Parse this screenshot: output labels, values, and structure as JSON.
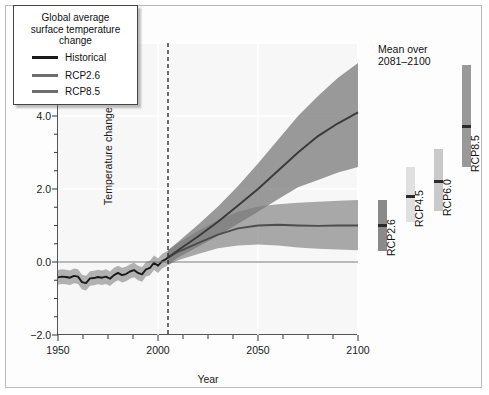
{
  "figure": {
    "background": "#ffffff",
    "frame_color": "#b9b9b9"
  },
  "axes": {
    "xlabel": "Year",
    "ylabel": "Temperature change (°C)",
    "xlim": [
      1950,
      2100
    ],
    "ylim": [
      -2.0,
      6.0
    ],
    "xticks": [
      1950,
      2000,
      2050,
      2100
    ],
    "xtick_labels": [
      "1950",
      "2000",
      "2050",
      "2100"
    ],
    "xticks_minor_step": 12.5,
    "yticks": [
      -2.0,
      0.0,
      2.0,
      4.0,
      6.0
    ],
    "ytick_labels": [
      "−2.0",
      "0.0",
      "2.0",
      "4.0",
      "6.0"
    ],
    "yticks_minor_step": 0.5,
    "grid": true,
    "grid_color": "#ffffff",
    "zero_line": 0.0,
    "historical_end_year": 2005
  },
  "legend": {
    "title": "Global average\nsurface temperature\nchange",
    "title_lines": [
      "Global average",
      "surface temperature",
      "change"
    ],
    "position": "upper-left-inside",
    "entries": [
      {
        "label": "Historical",
        "color": "#1a1a1a"
      },
      {
        "label": "RCP2.6",
        "color": "#6e6e6e"
      },
      {
        "label": "RCP8.5",
        "color": "#6e6e6e"
      }
    ]
  },
  "side_panel": {
    "title": "Mean over\n2081–2100",
    "title_lines": [
      "Mean over",
      "2081–2100"
    ],
    "bars": [
      {
        "label": "RCP2.6",
        "low": 0.3,
        "high": 1.7,
        "mean": 1.0,
        "color": "#8a8a8a"
      },
      {
        "label": "RCP4.5",
        "low": 1.1,
        "high": 2.6,
        "mean": 1.8,
        "color": "#e0e0e0"
      },
      {
        "label": "RCP6.0",
        "low": 1.4,
        "high": 3.1,
        "mean": 2.2,
        "color": "#c9c9c9"
      },
      {
        "label": "RCP8.5",
        "low": 2.6,
        "high": 5.4,
        "mean": 3.7,
        "color": "#999999"
      }
    ]
  },
  "chart_data": {
    "type": "line",
    "xlabel": "Year",
    "ylabel": "Temperature change (°C)",
    "xlim": [
      1950,
      2100
    ],
    "ylim": [
      -2.0,
      6.0
    ],
    "grid": true,
    "legend_position": "upper-left",
    "annotations": [
      {
        "type": "vline",
        "x": 2005,
        "style": "dashed",
        "label": "historical / projection split"
      },
      {
        "type": "hline",
        "y": 0.0,
        "style": "solid"
      }
    ],
    "series": [
      {
        "name": "Historical",
        "color": "#1a1a1a",
        "band_color": "#9a9a9a",
        "x": [
          1950,
          1952,
          1954,
          1956,
          1958,
          1960,
          1962,
          1964,
          1966,
          1968,
          1970,
          1972,
          1974,
          1976,
          1978,
          1980,
          1982,
          1984,
          1986,
          1988,
          1990,
          1992,
          1994,
          1996,
          1998,
          2000,
          2002,
          2004,
          2005
        ],
        "values": [
          -0.42,
          -0.4,
          -0.41,
          -0.43,
          -0.38,
          -0.4,
          -0.55,
          -0.58,
          -0.45,
          -0.44,
          -0.41,
          -0.43,
          -0.4,
          -0.46,
          -0.36,
          -0.3,
          -0.36,
          -0.33,
          -0.26,
          -0.22,
          -0.3,
          -0.34,
          -0.2,
          -0.16,
          -0.02,
          -0.1,
          0.02,
          0.08,
          0.12
        ],
        "band_low": [
          -0.62,
          -0.6,
          -0.61,
          -0.63,
          -0.58,
          -0.6,
          -0.75,
          -0.78,
          -0.65,
          -0.64,
          -0.61,
          -0.63,
          -0.6,
          -0.66,
          -0.56,
          -0.5,
          -0.56,
          -0.53,
          -0.46,
          -0.42,
          -0.5,
          -0.54,
          -0.4,
          -0.36,
          -0.22,
          -0.3,
          -0.18,
          -0.12,
          -0.08
        ],
        "band_high": [
          -0.22,
          -0.2,
          -0.21,
          -0.23,
          -0.18,
          -0.2,
          -0.35,
          -0.38,
          -0.25,
          -0.24,
          -0.21,
          -0.23,
          -0.2,
          -0.26,
          -0.16,
          -0.1,
          -0.16,
          -0.13,
          -0.06,
          -0.02,
          -0.1,
          -0.14,
          0.0,
          0.04,
          0.18,
          0.1,
          0.22,
          0.28,
          0.32
        ]
      },
      {
        "name": "RCP2.6",
        "color": "#4d4d4d",
        "band_color": "#8e8e8e",
        "x": [
          2005,
          2010,
          2020,
          2030,
          2040,
          2050,
          2060,
          2070,
          2080,
          2090,
          2100
        ],
        "values": [
          0.12,
          0.28,
          0.52,
          0.75,
          0.92,
          1.0,
          1.02,
          1.0,
          0.99,
          1.0,
          1.0
        ],
        "band_low": [
          -0.08,
          0.05,
          0.22,
          0.38,
          0.45,
          0.48,
          0.45,
          0.4,
          0.36,
          0.34,
          0.32
        ],
        "band_high": [
          0.32,
          0.52,
          0.85,
          1.15,
          1.38,
          1.52,
          1.58,
          1.62,
          1.65,
          1.68,
          1.7
        ]
      },
      {
        "name": "RCP8.5",
        "color": "#3a3a3a",
        "band_color": "#7a7a7a",
        "x": [
          2005,
          2010,
          2020,
          2030,
          2040,
          2050,
          2060,
          2070,
          2080,
          2090,
          2100
        ],
        "values": [
          0.12,
          0.32,
          0.7,
          1.1,
          1.55,
          2.0,
          2.5,
          3.0,
          3.45,
          3.8,
          4.1
        ],
        "band_low": [
          -0.08,
          0.12,
          0.42,
          0.72,
          1.05,
          1.38,
          1.72,
          2.05,
          2.25,
          2.45,
          2.6
        ],
        "band_high": [
          0.32,
          0.55,
          1.02,
          1.52,
          2.08,
          2.7,
          3.35,
          4.0,
          4.55,
          5.05,
          5.45
        ]
      }
    ],
    "side_bars": {
      "title": "Mean over 2081–2100",
      "categories": [
        "RCP2.6",
        "RCP4.5",
        "RCP6.0",
        "RCP8.5"
      ],
      "means": [
        1.0,
        1.8,
        2.2,
        3.7
      ],
      "low": [
        0.3,
        1.1,
        1.4,
        2.6
      ],
      "high": [
        1.7,
        2.6,
        3.1,
        5.4
      ]
    }
  }
}
